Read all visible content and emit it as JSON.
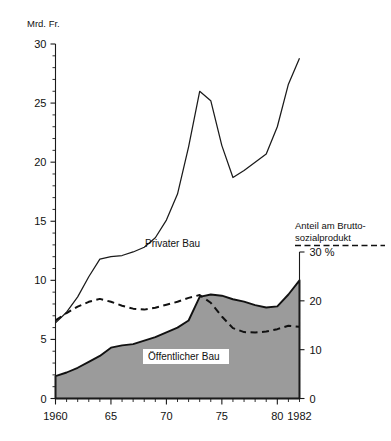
{
  "chart_data": {
    "type": "area",
    "title": "",
    "left_axis": {
      "label": "Mrd. Fr.",
      "ticks": [
        0,
        5,
        10,
        15,
        20,
        25,
        30
      ],
      "tick_labels": [
        "0",
        "5",
        "10",
        "15",
        "20",
        "25",
        "30"
      ],
      "range": [
        0,
        30
      ],
      "minor_tick_step": 1
    },
    "right_axis": {
      "label": "Anteil am Brutto-\nsozialprodukt",
      "label_line1": "Anteil am Brutto-",
      "label_line2": "sozialprodukt",
      "ticks": [
        0,
        10,
        20,
        30
      ],
      "tick_labels": [
        "0",
        "10",
        "20",
        "30 %"
      ],
      "range": [
        0,
        30
      ],
      "unit": "%"
    },
    "xlabel": "",
    "x": [
      1960,
      1961,
      1962,
      1963,
      1964,
      1965,
      1966,
      1967,
      1968,
      1969,
      1970,
      1971,
      1972,
      1973,
      1974,
      1975,
      1976,
      1977,
      1978,
      1979,
      1980,
      1981,
      1982
    ],
    "x_tick_labels": [
      "1960",
      "65",
      "70",
      "75",
      "80",
      "1982"
    ],
    "x_tick_values": [
      1960,
      1965,
      1970,
      1975,
      1980,
      1982
    ],
    "x_range": [
      1960,
      1982
    ],
    "grid": false,
    "legend_position": "inline",
    "series": [
      {
        "name": "Privater Bau",
        "label": "Privater Bau",
        "style": "line",
        "axis": "left",
        "unit": "Mrd. Fr.",
        "comment": "total construction, upper boundary",
        "values": [
          6.4,
          7.3,
          8.6,
          10.3,
          11.8,
          12.0,
          12.1,
          12.4,
          12.8,
          13.6,
          15.1,
          17.3,
          21.3,
          26.0,
          25.2,
          21.4,
          18.7,
          19.3,
          20.0,
          20.7,
          23.0,
          26.6,
          28.8
        ]
      },
      {
        "name": "Öffentlicher Bau",
        "label": "Öffentlicher Bau",
        "style": "area-filled",
        "axis": "left",
        "unit": "Mrd. Fr.",
        "fill_color": "#9b9b9b",
        "values": [
          1.9,
          2.2,
          2.6,
          3.1,
          3.6,
          4.3,
          4.5,
          4.6,
          4.9,
          5.2,
          5.6,
          6.0,
          6.6,
          8.6,
          8.8,
          8.7,
          8.4,
          8.2,
          7.9,
          7.7,
          7.8,
          8.8,
          10.0
        ]
      },
      {
        "name": "Anteil am Bruttosozialprodukt",
        "label": "Anteil am Brutto-sozialprodukt",
        "style": "dashed",
        "axis": "right",
        "unit": "%",
        "values": [
          16.0,
          17.5,
          18.8,
          19.8,
          20.4,
          19.8,
          19.0,
          18.4,
          18.2,
          18.6,
          19.2,
          19.8,
          20.6,
          21.2,
          19.6,
          16.8,
          14.4,
          13.6,
          13.5,
          13.7,
          14.2,
          14.9,
          14.7
        ]
      }
    ],
    "annotations": [
      {
        "text": "Privater Bau",
        "x": 1971,
        "y": 12.8
      },
      {
        "text": "Öffentlicher Bau",
        "x": 1974,
        "y": 4.2
      }
    ]
  }
}
